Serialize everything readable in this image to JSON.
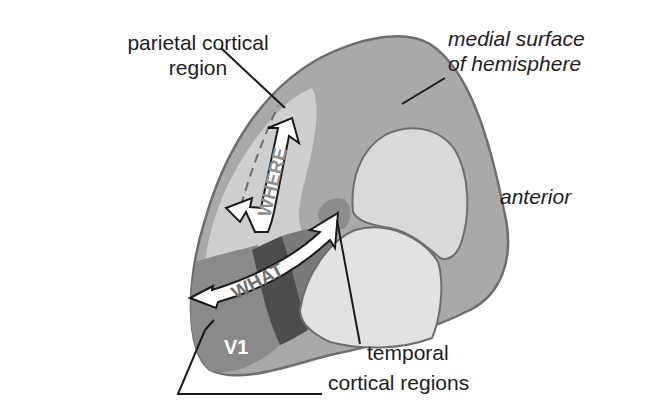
{
  "labels": {
    "parietal_line1": "parietal cortical",
    "parietal_line2": "region",
    "medial_line1": "medial surface",
    "medial_line2": "of hemisphere",
    "anterior": "anterior",
    "temporal_line1": "temporal",
    "temporal_line2": "cortical regions",
    "v1": "V1"
  },
  "arrows": {
    "where": "WHERE",
    "what": "WHAT"
  },
  "colors": {
    "outline": "#6e6e6e",
    "medial_surface": "#a9a9a9",
    "inner_lobe": "#d9d9d9",
    "lower_lobe": "#e2e2e2",
    "parietal": "#cfcfcf",
    "v1_region": "#8a8a8a",
    "dark_stream": "#4d4d4d",
    "mid_stream": "#7a7a7a",
    "temporal_spot": "#8c8c8c",
    "arrow_fill": "#ffffff",
    "arrow_text": "#8f8f8f",
    "leader": "#1a1a1a"
  }
}
